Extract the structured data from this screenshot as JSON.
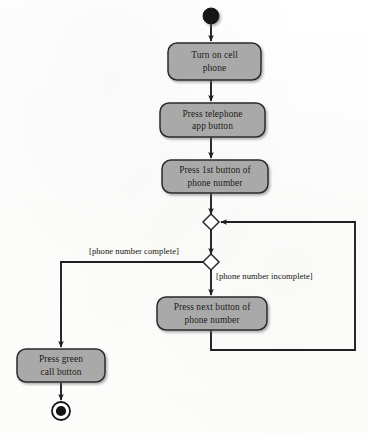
{
  "diagram": {
    "type": "uml-activity-diagram",
    "colors": {
      "node_fill": "#a9a9a9",
      "node_stroke": "#2b2b2b",
      "edge": "#1f1f1f",
      "text": "#14120f",
      "background": "#fdfdfd"
    },
    "nodes": [
      {
        "id": "start",
        "kind": "initial-node",
        "label": "",
        "cx": 211,
        "cy": 16
      },
      {
        "id": "act1",
        "kind": "action",
        "label": "Turn on cell phone",
        "line1": "Turn on cell",
        "line2": "phone",
        "x": 168,
        "y": 43,
        "w": 93,
        "h": 37
      },
      {
        "id": "act2",
        "kind": "action",
        "label": "Press telephone app button",
        "line1": "Press telephone",
        "line2": "app button",
        "x": 160,
        "y": 103,
        "w": 105,
        "h": 34
      },
      {
        "id": "act3",
        "kind": "action",
        "label": "Press 1st button of phone number",
        "line1": "Press 1st button of",
        "line2": "phone number",
        "x": 162,
        "y": 160,
        "w": 106,
        "h": 33
      },
      {
        "id": "merge",
        "kind": "merge-node",
        "label": "",
        "cx": 211,
        "cy": 222
      },
      {
        "id": "decision",
        "kind": "decision-node",
        "label": "",
        "cx": 211,
        "cy": 262
      },
      {
        "id": "act4",
        "kind": "action",
        "label": "Press next button of phone number",
        "line1": "Press next button of",
        "line2": "phone number",
        "x": 157,
        "y": 297,
        "w": 110,
        "h": 33
      },
      {
        "id": "act5",
        "kind": "action",
        "label": "Press green call button",
        "line1": "Press green",
        "line2": "call button",
        "x": 17,
        "y": 349,
        "w": 88,
        "h": 33
      },
      {
        "id": "final",
        "kind": "final-node",
        "label": "",
        "cx": 61,
        "cy": 411
      }
    ],
    "edges": [
      {
        "from": "start",
        "to": "act1",
        "guard": ""
      },
      {
        "from": "act1",
        "to": "act2",
        "guard": ""
      },
      {
        "from": "act2",
        "to": "act3",
        "guard": ""
      },
      {
        "from": "act3",
        "to": "merge",
        "guard": ""
      },
      {
        "from": "merge",
        "to": "decision",
        "guard": ""
      },
      {
        "from": "decision",
        "to": "act5",
        "guard": "[phone number complete]"
      },
      {
        "from": "decision",
        "to": "act4",
        "guard": "[phone number incomplete]"
      },
      {
        "from": "act4",
        "to": "merge",
        "guard": ""
      },
      {
        "from": "act5",
        "to": "final",
        "guard": ""
      }
    ],
    "guards": {
      "complete": "[phone number complete]",
      "incomplete": "[phone number incomplete]"
    }
  }
}
